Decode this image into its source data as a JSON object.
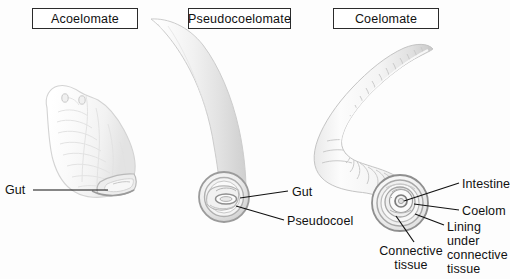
{
  "figure": {
    "background_color": "#fdfdfd",
    "ink_color": "#111111",
    "width": 510,
    "height": 279
  },
  "panels": [
    {
      "id": "acoelomate",
      "title": "Acoelomate",
      "organism": "flatworm"
    },
    {
      "id": "pseudocoelomate",
      "title": "Pseudocoelomate",
      "organism": "roundworm"
    },
    {
      "id": "coelomate",
      "title": "Coelomate",
      "organism": "earthworm"
    }
  ],
  "labels": {
    "gut_acoelomate": "Gut",
    "gut_pseudocoelomate": "Gut",
    "pseudocoel": "Pseudocoel",
    "intestine": "Intestine",
    "coelom": "Coelom",
    "lining_under_connective_tissue": "Lining under connective tissue",
    "connective_tissue": "Connective tissue"
  }
}
